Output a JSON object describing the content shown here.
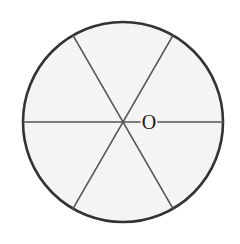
{
  "figure": {
    "kind": "geometry-diagram",
    "background_color": "#ffffff"
  },
  "circle": {
    "name": "circle-outline",
    "center_x": 123,
    "center_y": 122,
    "radius": 100,
    "stroke_color": "#333333",
    "stroke_width": 2.6,
    "fill_color": "#f4f4f4"
  },
  "diameters": [
    {
      "name": "horizontal-diameter",
      "angle_degrees": 0,
      "x1": 23,
      "y1": 122,
      "x2": 223,
      "y2": 122,
      "stroke_color": "#555555",
      "stroke_width": 1.6
    },
    {
      "name": "diameter-60",
      "angle_degrees": 60,
      "x1": 73,
      "y1": 208.6,
      "x2": 173,
      "y2": 35.4,
      "stroke_color": "#555555",
      "stroke_width": 1.6
    },
    {
      "name": "diameter-120",
      "angle_degrees": 120,
      "x1": 73,
      "y1": 35.4,
      "x2": 173,
      "y2": 208.6,
      "stroke_color": "#555555",
      "stroke_width": 1.6
    }
  ],
  "labels": {
    "center_point": {
      "text": "O",
      "x": 149,
      "y": 123,
      "font_size": 20,
      "color": "#1c1c1c"
    }
  },
  "sector_count": 6,
  "sector_angle_degrees": 60
}
